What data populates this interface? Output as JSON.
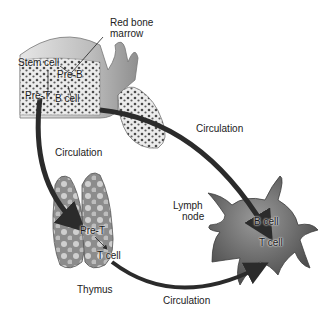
{
  "diagram": {
    "organs": {
      "bone_marrow": {
        "label_line1": "Red bone",
        "label_line2": "marrow",
        "cells": [
          "Stem cell",
          "Pre-B",
          "Pre-T",
          "B cell"
        ]
      },
      "thymus": {
        "label": "Thymus",
        "cells": [
          "Pre-T",
          "T cell"
        ]
      },
      "lymph_node": {
        "label_line1": "Lymph",
        "label_line2": "node",
        "cells": [
          "B cell",
          "T cell"
        ]
      }
    },
    "arrows": [
      {
        "from": "bone_marrow",
        "to": "lymph_node",
        "label": "Circulation"
      },
      {
        "from": "bone_marrow",
        "to": "thymus",
        "label": "Circulation"
      },
      {
        "from": "thymus",
        "to": "lymph_node",
        "label": "Circulation"
      }
    ],
    "colors": {
      "bone": "#d9d9d9",
      "marrow_dots": "#555555",
      "arrow": "#2b2b2b",
      "thymus": "#8a8a8a",
      "lymph_node": "#6e6e6e"
    }
  }
}
